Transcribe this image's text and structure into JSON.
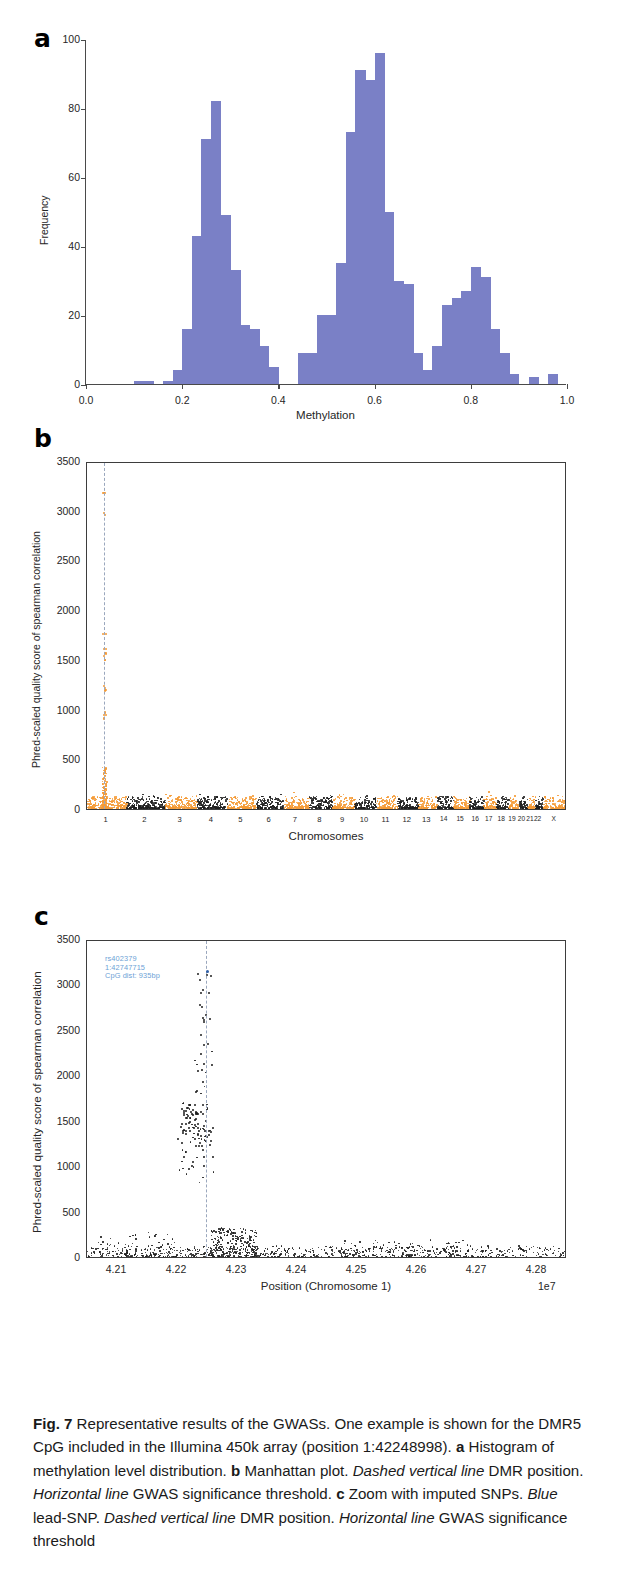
{
  "figure": {
    "label": "Fig. 7",
    "caption_segments": [
      {
        "text": "Fig. 7",
        "style": "bold"
      },
      {
        "text": " Representative results of the GWASs. One example is shown for the DMR5 CpG included in the Illumina 450k array (position 1:42248998). ",
        "style": "normal"
      },
      {
        "text": "a",
        "style": "bold"
      },
      {
        "text": " Histogram of methylation level distribution. ",
        "style": "normal"
      },
      {
        "text": "b",
        "style": "bold"
      },
      {
        "text": " Manhattan plot. ",
        "style": "normal"
      },
      {
        "text": "Dashed vertical line",
        "style": "italic"
      },
      {
        "text": " DMR position. ",
        "style": "normal"
      },
      {
        "text": "Horizontal line",
        "style": "italic"
      },
      {
        "text": " GWAS significance threshold. ",
        "style": "normal"
      },
      {
        "text": "c",
        "style": "bold"
      },
      {
        "text": " Zoom with imputed SNPs. ",
        "style": "normal"
      },
      {
        "text": "Blue",
        "style": "italic"
      },
      {
        "text": " lead-SNP. ",
        "style": "normal"
      },
      {
        "text": "Dashed vertical line",
        "style": "italic"
      },
      {
        "text": " DMR position. ",
        "style": "normal"
      },
      {
        "text": "Horizontal line",
        "style": "italic"
      },
      {
        "text": " GWAS significance threshold",
        "style": "normal"
      }
    ],
    "caption_plain": "Fig. 7 Representative results of the GWASs. One example is shown for the DMR5 CpG included in the Illumina 450k array (position 1:42248998). a Histogram of methylation level distribution. b Manhattan plot. Dashed vertical line DMR position. Horizontal line GWAS significance threshold. c Zoom with imputed SNPs. Blue lead-SNP. Dashed vertical line DMR position. Horizontal line GWAS significance threshold"
  },
  "panels": {
    "a": {
      "letter": "a"
    },
    "b": {
      "letter": "b"
    },
    "c": {
      "letter": "c"
    }
  },
  "colors": {
    "histogram_bar": "#7a80c6",
    "manhattan_odd": "#f59a35",
    "manhattan_even": "#1f1f1f",
    "lead_snp": "#2f5fa8",
    "annotation_text": "#6d9fd6",
    "dashed_line": "#9aa7bd",
    "axis": "#3d3d3d"
  },
  "chart_data": [
    {
      "panel": "a",
      "type": "bar",
      "title": "",
      "xlabel": "Methylation",
      "ylabel": "Frequency",
      "xlim": [
        0.0,
        1.0
      ],
      "ylim": [
        0,
        100
      ],
      "xticks": [
        "0.0",
        "0.2",
        "0.4",
        "0.6",
        "0.8",
        "1.0"
      ],
      "xtick_values": [
        0.0,
        0.2,
        0.4,
        0.6,
        0.8,
        1.0
      ],
      "yticks": [
        "0",
        "20",
        "40",
        "60",
        "80",
        "100"
      ],
      "ytick_values": [
        0,
        20,
        40,
        60,
        80,
        100
      ],
      "grid": false,
      "bin_width": 0.02,
      "bin_starts": [
        0.1,
        0.12,
        0.16,
        0.18,
        0.2,
        0.22,
        0.24,
        0.26,
        0.28,
        0.3,
        0.32,
        0.34,
        0.36,
        0.38,
        0.44,
        0.46,
        0.48,
        0.5,
        0.52,
        0.54,
        0.56,
        0.58,
        0.6,
        0.62,
        0.64,
        0.66,
        0.68,
        0.7,
        0.72,
        0.74,
        0.76,
        0.78,
        0.8,
        0.82,
        0.84,
        0.86,
        0.88,
        0.92,
        0.96
      ],
      "values": [
        1,
        1,
        1,
        4,
        16,
        43,
        71,
        82,
        49,
        33,
        17,
        16,
        11,
        5,
        9,
        9,
        20,
        20,
        35,
        73,
        91,
        88,
        96,
        50,
        30,
        29,
        9,
        4,
        11,
        23,
        25,
        27,
        34,
        31,
        16,
        9,
        3,
        2,
        3
      ]
    },
    {
      "panel": "b",
      "type": "scatter",
      "title": "",
      "xlabel": "Chromosomes",
      "ylabel": "Phred-scaled quality score of spearman correlation",
      "ylim": [
        0,
        3500
      ],
      "yticks": [
        "0",
        "500",
        "1000",
        "1500",
        "2000",
        "2500",
        "3000",
        "3500"
      ],
      "ytick_values": [
        0,
        500,
        1000,
        1500,
        2000,
        2500,
        3000,
        3500
      ],
      "xticks": [
        "1",
        "2",
        "3",
        "4",
        "5",
        "6",
        "7",
        "8",
        "9",
        "10",
        "11",
        "12",
        "13",
        "14",
        "15",
        "16",
        "17",
        "18",
        "19",
        "20",
        "21",
        "22",
        "X"
      ],
      "chromosome_widths": [
        8.0,
        7.9,
        6.5,
        6.2,
        5.9,
        5.6,
        5.2,
        4.8,
        4.5,
        4.4,
        4.4,
        4.3,
        3.7,
        3.4,
        3.3,
        2.9,
        2.6,
        2.5,
        1.9,
        2.0,
        1.5,
        1.6,
        5.0
      ],
      "dmr_position_chr": 1,
      "dmr_x_fraction": 0.035,
      "note": "Only chromosome 1 shows high-scoring points; all other chromosomes hover near zero baseline.",
      "top_points": [
        3180,
        2960,
        1750,
        1600,
        1570,
        1540,
        1500,
        1220,
        1180,
        960,
        930,
        900
      ],
      "baseline_max": 120
    },
    {
      "panel": "c",
      "type": "scatter",
      "title": "",
      "xlabel": "Position (Chromosome 1)",
      "ylabel": "Phred-scaled quality score of spearman correlation",
      "x_exponent": "1e7",
      "xlim": [
        4.205,
        4.285
      ],
      "ylim": [
        0,
        3500
      ],
      "xticks": [
        "4.21",
        "4.22",
        "4.23",
        "4.24",
        "4.25",
        "4.26",
        "4.27",
        "4.28"
      ],
      "xtick_values": [
        4.21,
        4.22,
        4.23,
        4.24,
        4.25,
        4.26,
        4.27,
        4.28
      ],
      "yticks": [
        "0",
        "500",
        "1000",
        "1500",
        "2000",
        "2500",
        "3000",
        "3500"
      ],
      "ytick_values": [
        0,
        500,
        1000,
        1500,
        2000,
        2500,
        3000,
        3500
      ],
      "grid": false,
      "annotation": {
        "rsid": "rs402379",
        "position": "1:42747715",
        "cpg_distance": "CpG dist: 935bp"
      },
      "lead_snp": {
        "x": 4.2248,
        "y": 3180
      },
      "dmr_x": 4.2249,
      "cluster_summary": "Dense low baseline across range with a tall spike of points from ~900-3200 near x=4.222-4.2255"
    }
  ]
}
